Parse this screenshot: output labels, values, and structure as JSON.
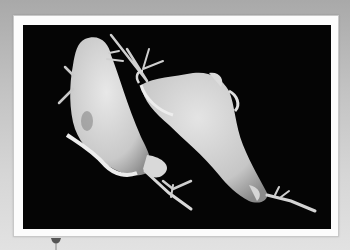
{
  "image": {
    "subject": "scanning electron micrograph of two flagellated protozoa",
    "description": "Two pale gray, teardrop-shaped flagellated cells with undulating membranes and trailing flagella on a black background"
  },
  "frame": {
    "border_color": "#fcfcfc",
    "photo_background": "#050505",
    "page_background_top": "#a9a9a9",
    "page_background_bottom": "#e2e2e2"
  },
  "pin": {
    "color": "#555555"
  }
}
